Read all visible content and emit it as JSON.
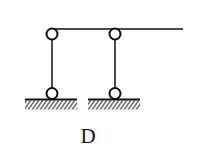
{
  "figure": {
    "label": "D",
    "stroke_color": "#111111",
    "beam": {
      "x1": 50,
      "y1": 30,
      "x2": 183,
      "y2": 30
    },
    "links": [
      {
        "name": "left-link",
        "top_hinge": [
          52,
          34
        ],
        "bottom_hinge": [
          52,
          94
        ]
      },
      {
        "name": "right-link",
        "top_hinge": [
          115,
          34
        ],
        "bottom_hinge": [
          115,
          94
        ]
      }
    ],
    "grounds": [
      {
        "name": "left-ground",
        "x1": 25,
        "x2": 77,
        "y": 99
      },
      {
        "name": "right-ground",
        "x1": 88,
        "x2": 140,
        "y": 99
      }
    ]
  }
}
